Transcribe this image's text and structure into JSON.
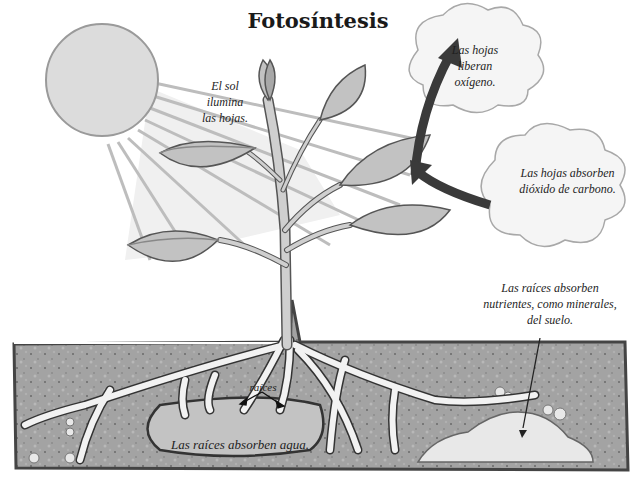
{
  "title": "Fotosíntesis",
  "labels": {
    "sun": [
      "El sol",
      "ilumina",
      "las hojas."
    ],
    "oxygen": [
      "Las hojas",
      "liberan",
      "oxígeno."
    ],
    "co2": [
      "Las hojas absorben",
      "dióxido de carbono."
    ],
    "nutrients": [
      "Las raíces absorben",
      "nutrientes, como minerales,",
      "del suelo."
    ],
    "roots": "raíces",
    "water": "Las raíces absorben agua."
  },
  "colors": {
    "sun": "#d9d9d9",
    "soil": "#9a9a9a",
    "soil_border": "#444444",
    "water_pool": "#bdbdbd",
    "leaf": "#bfbfbf",
    "arrow": "#3a3a3a",
    "cloud": "#f4f4f4"
  }
}
